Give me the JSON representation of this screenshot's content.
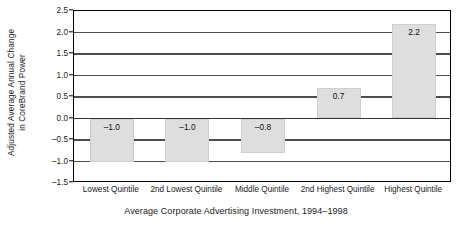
{
  "chart_data": {
    "type": "bar",
    "title": "",
    "subtitle": "",
    "categories": [
      "Lowest Quintile",
      "2nd Lowest Quintile",
      "Middle Quintile",
      "2nd Highest Quintile",
      "Highest Quintile"
    ],
    "values": [
      -1.0,
      -1.0,
      -0.8,
      0.7,
      2.2
    ],
    "data_labels": [
      "–1.0",
      "–1.0",
      "–0.8",
      "0.7",
      "2.2"
    ],
    "xlabel": "Average Corporate Advertising Investment, 1994–1998",
    "ylabel_line1": "Adjusted Average Annual Change",
    "ylabel_line2": "in CoreBrand Power",
    "ylim": [
      -1.5,
      2.5
    ],
    "ytick_values": [
      2.5,
      2.0,
      1.5,
      1.0,
      0.5,
      0.0,
      -0.5,
      -1.0,
      -1.5
    ],
    "ytick_labels": [
      "2.5",
      "2.0",
      "1.5",
      "1.0",
      "0.5",
      "0.0",
      "–0.5",
      "–1.0",
      "–1.5"
    ],
    "grid": true,
    "grid_axis": "y",
    "legend": null,
    "legend_position": "none",
    "colors": {
      "bar_fill": "#dedede",
      "bar_edge": "#cfcfcf",
      "gridline": "#4d4d4d",
      "axis": "#000000",
      "text": "#1a1a1a",
      "background": "#ffffff"
    }
  }
}
